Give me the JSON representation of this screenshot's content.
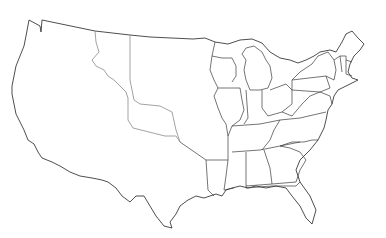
{
  "map": {
    "title": "",
    "type": "blank outline map",
    "region": "United States (contiguous)",
    "labels_visible": false,
    "colors": {
      "background": "#ffffff",
      "state_border": "#3a3a3a",
      "territory_border": "#8a8a8a"
    },
    "regions": [
      {
        "id": "western-territory",
        "kind": "territory"
      },
      {
        "id": "central-territory",
        "kind": "territory"
      },
      {
        "id": "texas",
        "kind": "region"
      },
      {
        "id": "eastern-states",
        "kind": "states"
      }
    ]
  }
}
